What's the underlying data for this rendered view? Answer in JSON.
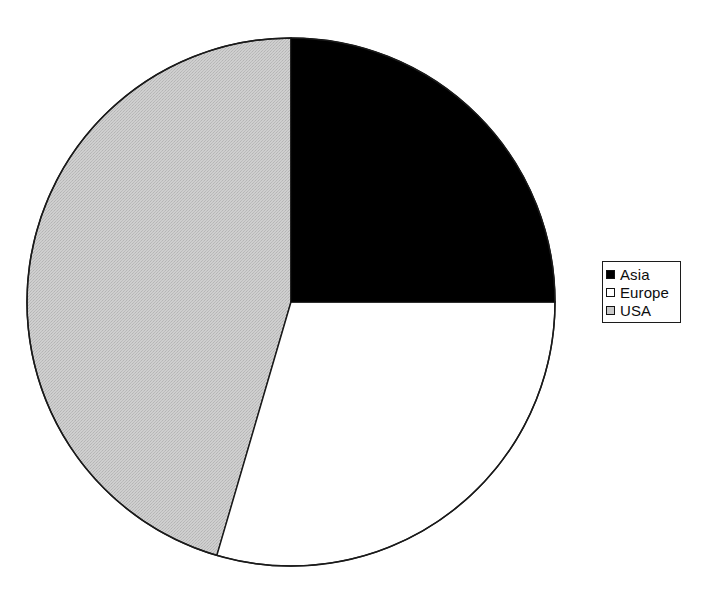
{
  "figure": {
    "type": "pie-chart",
    "background_color": "#ffffff",
    "width": 718,
    "height": 596
  },
  "pie": {
    "center_x": 291,
    "center_y": 302,
    "radius": 264,
    "outline_color": "#1a1a1a",
    "start_angle_deg": 0,
    "direction": "clockwise"
  },
  "legend": {
    "position": "right",
    "border_color": "#1c1c1c",
    "background_color": "#ffffff",
    "items": [
      {
        "label": "Asia",
        "swatch_fill": "#000000",
        "swatch_border": "#121212"
      },
      {
        "label": "Europe",
        "swatch_fill": "#ffffff",
        "swatch_border": "#121212"
      },
      {
        "label": "USA",
        "swatch_fill": "#c8c8c8",
        "swatch_border": "#121212"
      }
    ]
  },
  "chart_data": {
    "type": "pie",
    "title": "",
    "subtitle": "",
    "xlabel": "",
    "ylabel": "",
    "legend_position": "right",
    "grid": false,
    "labels": [
      "Asia",
      "Europe",
      "USA"
    ],
    "values": [
      25.0,
      29.5,
      45.5
    ],
    "units": "percent",
    "colors": [
      "#000000",
      "#ffffff",
      "#c8c8c8"
    ],
    "slices": [
      {
        "label": "Asia",
        "value": 25.0,
        "start_angle_deg": 0.0,
        "end_angle_deg": 90.0,
        "sweep_deg": 90.0,
        "fill": "#000000",
        "fill_style": "solid"
      },
      {
        "label": "Europe",
        "value": 29.5,
        "start_angle_deg": 90.0,
        "end_angle_deg": 196.3,
        "sweep_deg": 106.3,
        "fill": "#ffffff",
        "fill_style": "solid"
      },
      {
        "label": "USA",
        "value": 45.5,
        "start_angle_deg": 196.3,
        "end_angle_deg": 360.0,
        "sweep_deg": 163.7,
        "fill": "#c8c8c8",
        "fill_style": "halftone-dither"
      }
    ]
  }
}
